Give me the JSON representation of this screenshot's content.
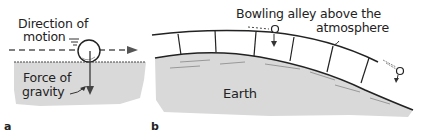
{
  "panels": [
    {
      "letter": "a",
      "labels": {
        "direction": "Direction of",
        "motion": "motion",
        "force": "Force of",
        "gravity": "gravity"
      }
    },
    {
      "letter": "b",
      "labels": {
        "alley_line1": "Bowling alley above the",
        "alley_line2": "atmosphere",
        "earth": "Earth"
      }
    }
  ],
  "colors": {
    "ground": "#d9d9d9",
    "ink": "#222222"
  }
}
